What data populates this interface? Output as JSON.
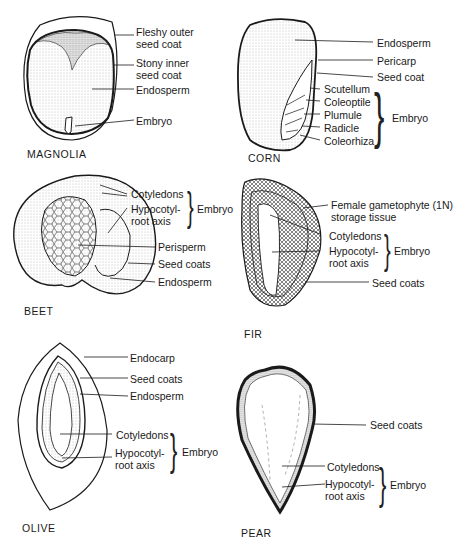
{
  "panels": {
    "magnolia": {
      "title": "MAGNOLIA",
      "labels": [
        "Fleshy outer",
        "seed coat",
        "Stony inner",
        "seed coat",
        "Endosperm",
        "Embryo"
      ]
    },
    "corn": {
      "title": "CORN",
      "labels": [
        "Endosperm",
        "Pericarp",
        "Seed coat",
        "Scutellum",
        "Coleoptile",
        "Plumule",
        "Radicle",
        "Coleorhiza"
      ],
      "group": "Embryo"
    },
    "beet": {
      "title": "BEET",
      "labels": [
        "Cotyledons",
        "Hypocotyl-",
        "root axis",
        "Perisperm",
        "Seed coats",
        "Endosperm"
      ],
      "group": "Embryo"
    },
    "fir": {
      "title": "FIR",
      "labels": [
        "Female gametophyte (1N)",
        "storage tissue",
        "Cotyledons",
        "Hypocotyl-",
        "root axis",
        "Seed coats"
      ],
      "group": "Embryo"
    },
    "olive": {
      "title": "OLIVE",
      "labels": [
        "Endocarp",
        "Seed coats",
        "Endosperm",
        "Cotyledons",
        "Hypocotyl-",
        "root axis"
      ],
      "group": "Embryo"
    },
    "pear": {
      "title": "PEAR",
      "labels": [
        "Seed coats",
        "Cotyledons",
        "Hypocotyl-",
        "root axis"
      ],
      "group": "Embryo"
    }
  },
  "colors": {
    "ink": "#1a1a1a",
    "stipple": "#9a9a9a",
    "background": "#ffffff"
  }
}
